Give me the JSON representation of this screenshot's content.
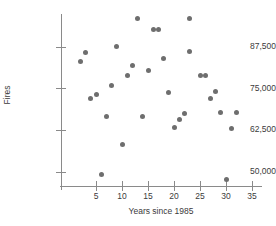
{
  "chart_data": {
    "type": "scatter",
    "title": "",
    "xlabel": "Years since 1985",
    "ylabel": "Fires",
    "xlim": [
      0,
      36
    ],
    "ylim": [
      46000,
      97000
    ],
    "xticks": [
      5,
      10,
      15,
      20,
      25,
      30,
      35
    ],
    "xtick_labels": [
      "5",
      "10",
      "15",
      "20",
      "25",
      "30",
      "35"
    ],
    "yticks": [
      50000,
      62500,
      75000,
      87500
    ],
    "ytick_labels": [
      "50,000",
      "62,500",
      "75,000",
      "87,500"
    ],
    "grid": false,
    "legend": null,
    "marker_color": "#6e6e6e",
    "axis_color": "#8a8a8a",
    "points": [
      {
        "x": 2,
        "y": 83000
      },
      {
        "x": 3,
        "y": 85800
      },
      {
        "x": 4,
        "y": 71800
      },
      {
        "x": 5,
        "y": 73000
      },
      {
        "x": 6,
        "y": 49200
      },
      {
        "x": 7,
        "y": 66500
      },
      {
        "x": 8,
        "y": 75800
      },
      {
        "x": 9,
        "y": 87400
      },
      {
        "x": 10,
        "y": 58200
      },
      {
        "x": 11,
        "y": 78800
      },
      {
        "x": 12,
        "y": 81800
      },
      {
        "x": 13,
        "y": 95900
      },
      {
        "x": 14,
        "y": 66500
      },
      {
        "x": 15,
        "y": 80200
      },
      {
        "x": 16,
        "y": 92600
      },
      {
        "x": 17,
        "y": 92600
      },
      {
        "x": 18,
        "y": 83900
      },
      {
        "x": 19,
        "y": 73600
      },
      {
        "x": 20,
        "y": 63200
      },
      {
        "x": 21,
        "y": 65500
      },
      {
        "x": 22,
        "y": 67400
      },
      {
        "x": 23,
        "y": 95900
      },
      {
        "x": 23,
        "y": 85900
      },
      {
        "x": 25,
        "y": 78800
      },
      {
        "x": 26,
        "y": 78800
      },
      {
        "x": 27,
        "y": 71900
      },
      {
        "x": 28,
        "y": 74100
      },
      {
        "x": 29,
        "y": 67600
      },
      {
        "x": 30,
        "y": 47500
      },
      {
        "x": 31,
        "y": 62900
      },
      {
        "x": 32,
        "y": 67800
      }
    ]
  }
}
